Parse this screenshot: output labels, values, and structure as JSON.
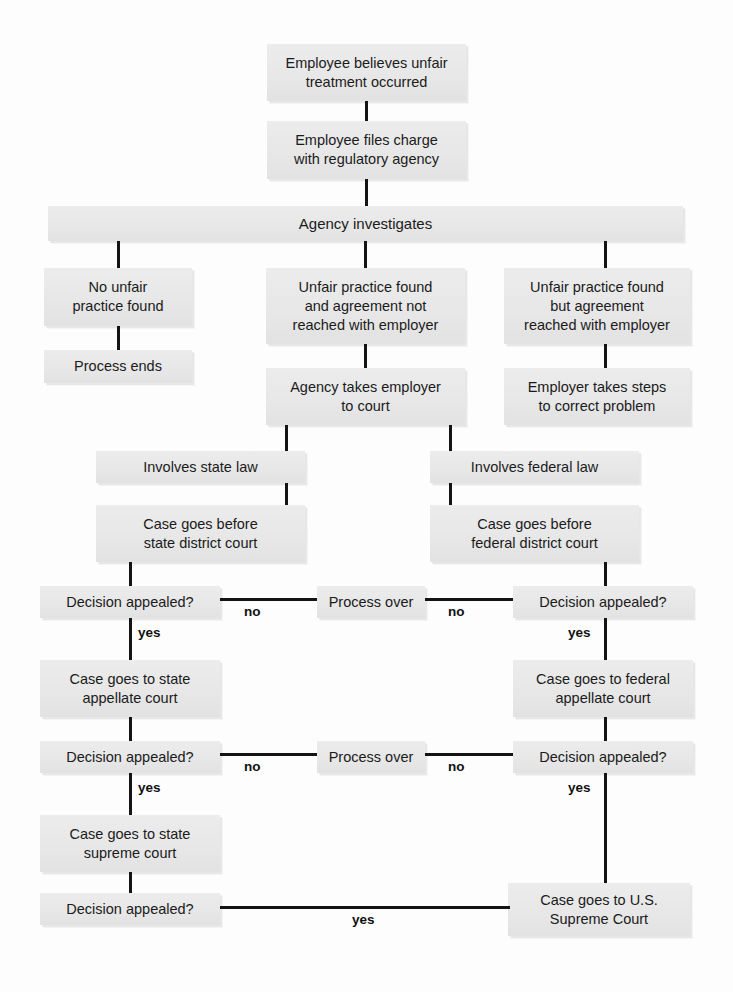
{
  "diagram": {
    "colors": {
      "box_fill": "#e9e9e9",
      "connector": "#141414",
      "text": "#1b1b1b",
      "background": "#fdfdfd"
    },
    "nodes": [
      {
        "id": "n1",
        "label": "Employee believes unfair\ntreatment occurred"
      },
      {
        "id": "n2",
        "label": "Employee files charge\nwith regulatory agency"
      },
      {
        "id": "n3",
        "label": "Agency investigates"
      },
      {
        "id": "n4",
        "label": "No unfair\npractice found"
      },
      {
        "id": "n5",
        "label": "Unfair practice found\nand agreement not\nreached with employer"
      },
      {
        "id": "n6",
        "label": "Unfair practice found\nbut agreement\nreached with employer"
      },
      {
        "id": "n7",
        "label": "Process ends"
      },
      {
        "id": "n8",
        "label": "Agency takes employer\nto court"
      },
      {
        "id": "n9",
        "label": "Employer takes steps\nto correct problem"
      },
      {
        "id": "n10",
        "label": "Involves state law"
      },
      {
        "id": "n11",
        "label": "Involves federal law"
      },
      {
        "id": "n12",
        "label": "Case goes before\nstate district court"
      },
      {
        "id": "n13",
        "label": "Case goes before\nfederal district court"
      },
      {
        "id": "n14",
        "label": "Decision appealed?"
      },
      {
        "id": "n15",
        "label": "Process over"
      },
      {
        "id": "n16",
        "label": "Decision appealed?"
      },
      {
        "id": "n17",
        "label": "Case goes to state\nappellate court"
      },
      {
        "id": "n18",
        "label": "Case goes to federal\nappellate court"
      },
      {
        "id": "n19",
        "label": "Decision appealed?"
      },
      {
        "id": "n20",
        "label": "Process over"
      },
      {
        "id": "n21",
        "label": "Decision appealed?"
      },
      {
        "id": "n22",
        "label": "Case goes to state\nsupreme court"
      },
      {
        "id": "n23",
        "label": "Decision appealed?"
      },
      {
        "id": "n24",
        "label": "Case goes to U.S.\nSupreme Court"
      }
    ],
    "edge_labels": {
      "no_1_left": "no",
      "no_1_right": "no",
      "yes_1_left": "yes",
      "yes_1_right": "yes",
      "no_2_left": "no",
      "no_2_right": "no",
      "yes_2_left": "yes",
      "yes_2_right": "yes",
      "yes_3_bottom": "yes"
    },
    "background_bleed": [
      "",
      "",
      ""
    ]
  }
}
